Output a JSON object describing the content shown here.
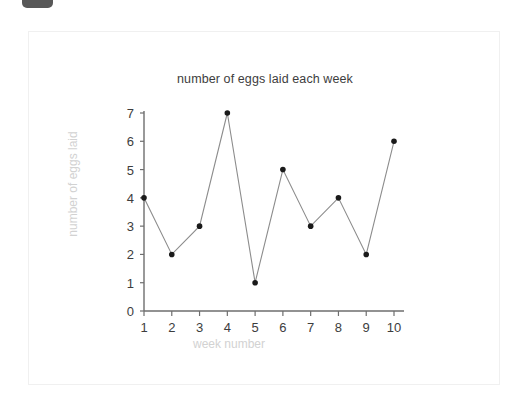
{
  "badge": {
    "name": "top-left-badge"
  },
  "chart_data": {
    "type": "line",
    "title": "number of eggs laid each week",
    "xlabel": "week number",
    "ylabel": "number of eggs laid",
    "x": [
      1,
      2,
      3,
      4,
      5,
      6,
      7,
      8,
      9,
      10
    ],
    "values": [
      4,
      2,
      3,
      7,
      1,
      5,
      3,
      4,
      2,
      6
    ],
    "categories": [
      "1",
      "2",
      "3",
      "4",
      "5",
      "6",
      "7",
      "8",
      "9",
      "10"
    ],
    "xtick_labels": [
      "1",
      "2",
      "3",
      "4",
      "5",
      "6",
      "7",
      "8",
      "9",
      "10"
    ],
    "ytick_labels": [
      "0",
      "1",
      "2",
      "3",
      "4",
      "5",
      "6",
      "7"
    ],
    "yticks": [
      0,
      1,
      2,
      3,
      4,
      5,
      6,
      7
    ],
    "xlim": [
      1,
      10
    ],
    "ylim": [
      0,
      7
    ],
    "grid": false,
    "legend": false,
    "line_color": "#8c8c8c",
    "marker_color": "#1a1a1a",
    "axis_color": "#6e6e6e",
    "title_color": "#3d3d3d",
    "axis_label_color": "#d2d2d2",
    "tick_label_color": "#3d3d3d",
    "marker": "dot"
  }
}
